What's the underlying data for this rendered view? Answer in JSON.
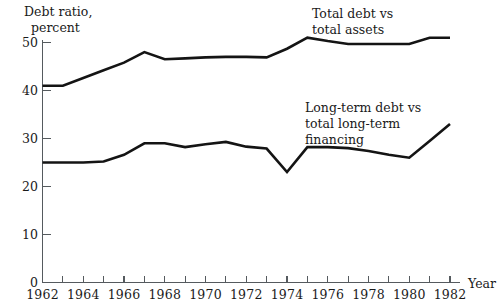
{
  "chart_data": {
    "type": "line",
    "title": "",
    "ylabel": "Debt  ratio,\npercent",
    "ylabel_line1": "Debt  ratio,",
    "ylabel_line2": "percent",
    "xlabel": "Year",
    "ylim": [
      0,
      52
    ],
    "xlim": [
      1962,
      1982.6
    ],
    "yticks": [
      0,
      10,
      20,
      30,
      40,
      50
    ],
    "ytick_labels": [
      "0",
      "10",
      "20",
      "30",
      "40",
      "50"
    ],
    "xticks": [
      1962,
      1963,
      1964,
      1965,
      1966,
      1967,
      1968,
      1969,
      1970,
      1971,
      1972,
      1973,
      1974,
      1975,
      1976,
      1977,
      1978,
      1979,
      1980,
      1981,
      1982
    ],
    "xtick_labels_shown": [
      "1962",
      "1964",
      "1966",
      "1968",
      "1970",
      "1972",
      "1974",
      "1976",
      "1978",
      "1980",
      "1982"
    ],
    "grid": false,
    "legend_position": "inline-annotations",
    "x": [
      1962,
      1963,
      1964,
      1965,
      1966,
      1967,
      1968,
      1969,
      1970,
      1971,
      1972,
      1973,
      1974,
      1975,
      1976,
      1977,
      1978,
      1979,
      1980,
      1981,
      1982
    ],
    "series": [
      {
        "name": "Total debt vs total assets",
        "label_line1": "Total debt vs",
        "label_line2": "total assets",
        "values": [
          41.0,
          41.0,
          42.6,
          44.2,
          45.8,
          48.0,
          46.5,
          46.7,
          46.9,
          47.0,
          47.0,
          46.9,
          48.7,
          51.0,
          50.3,
          49.7,
          49.7,
          49.7,
          49.7,
          51.0,
          51.0
        ]
      },
      {
        "name": "Long-term debt vs total long-term financing",
        "label_line1": "Long-term debt vs",
        "label_line2": "total long-term",
        "label_line3": "financing",
        "values": [
          25.0,
          25.0,
          25.0,
          25.2,
          26.6,
          29.0,
          29.0,
          28.2,
          28.8,
          29.3,
          28.3,
          27.9,
          23.0,
          28.2,
          28.2,
          28.0,
          27.4,
          26.6,
          26.0,
          29.5,
          33.0
        ]
      }
    ]
  },
  "annotations": {
    "series1_label_line1": "Total debt vs",
    "series1_label_line2": "total assets",
    "series2_label_line1": "Long-term debt vs",
    "series2_label_line2": "total long-term",
    "series2_label_line3": "financing"
  },
  "colors": {
    "line": "#141414",
    "axis": "#555a5e",
    "text": "#1a1a1a",
    "background": "#ffffff"
  }
}
